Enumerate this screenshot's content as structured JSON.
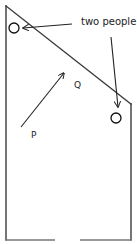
{
  "diagram": {
    "annotation": "two people",
    "labels": {
      "start": "P",
      "end": "Q"
    },
    "colors": {
      "line": "#3a3a3a",
      "text": "#222222",
      "background": "#ffffff"
    }
  }
}
